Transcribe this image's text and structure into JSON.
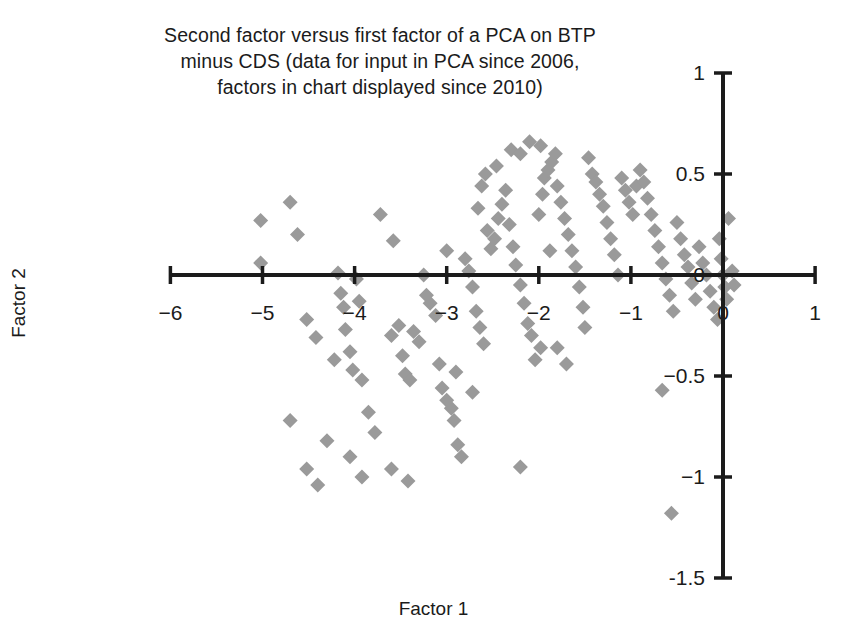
{
  "chart_data": {
    "type": "scatter",
    "title": "Second factor versus first factor of a PCA on BTP\nminus CDS (data for input in PCA since 2006,\nfactors in chart displayed since 2010)",
    "xlabel": "Factor 1",
    "ylabel": "Factor 2",
    "xlim": [
      -6.3,
      1.3
    ],
    "ylim": [
      -1.6,
      1.1
    ],
    "xticks": [
      -6,
      -5,
      -4,
      -3,
      -2,
      -1,
      0,
      1
    ],
    "xtick_labels": [
      "−6",
      "−5",
      "−4",
      "−3",
      "−2",
      "−1",
      "0",
      "1"
    ],
    "yticks": [
      1,
      0.5,
      0,
      -0.5,
      -1,
      -1.5
    ],
    "ytick_labels": [
      "1",
      "0.5",
      "0",
      "−0.5",
      "−1",
      "-1.5"
    ],
    "grid": false,
    "legend": null,
    "marker": "diamond",
    "marker_color": "#9a9a9a",
    "axis_color": "#1b1b1b",
    "axes_style": "crossed-at-origin",
    "series": [
      {
        "name": "BTP minus CDS PCA factors",
        "points": [
          [
            -5.02,
            0.27
          ],
          [
            -5.02,
            0.06
          ],
          [
            -4.52,
            -0.22
          ],
          [
            -4.42,
            -0.31
          ],
          [
            -4.22,
            -0.42
          ],
          [
            -4.18,
            0.01
          ],
          [
            -4.15,
            -0.09
          ],
          [
            -4.12,
            -0.16
          ],
          [
            -4.1,
            -0.27
          ],
          [
            -4.05,
            -0.38
          ],
          [
            -4.02,
            -0.47
          ],
          [
            -3.98,
            -0.02
          ],
          [
            -3.95,
            -0.13
          ],
          [
            -3.92,
            -0.52
          ],
          [
            -3.85,
            -0.68
          ],
          [
            -3.78,
            -0.78
          ],
          [
            -3.72,
            0.3
          ],
          [
            -3.6,
            -0.3
          ],
          [
            -3.58,
            0.17
          ],
          [
            -3.52,
            -0.25
          ],
          [
            -3.48,
            -0.4
          ],
          [
            -3.45,
            -0.49
          ],
          [
            -3.4,
            -0.52
          ],
          [
            -3.36,
            -0.28
          ],
          [
            -3.3,
            -0.33
          ],
          [
            -3.25,
            0.0
          ],
          [
            -3.22,
            -0.1
          ],
          [
            -3.18,
            -0.14
          ],
          [
            -3.12,
            -0.2
          ],
          [
            -3.08,
            -0.44
          ],
          [
            -3.05,
            -0.56
          ],
          [
            -3.0,
            -0.62
          ],
          [
            -2.95,
            -0.66
          ],
          [
            -2.92,
            -0.72
          ],
          [
            -2.88,
            -0.84
          ],
          [
            -2.84,
            -0.9
          ],
          [
            -2.8,
            0.08
          ],
          [
            -2.76,
            0.02
          ],
          [
            -2.72,
            -0.06
          ],
          [
            -2.68,
            -0.18
          ],
          [
            -2.64,
            -0.26
          ],
          [
            -2.6,
            -0.34
          ],
          [
            -2.56,
            0.22
          ],
          [
            -2.52,
            0.13
          ],
          [
            -2.48,
            0.18
          ],
          [
            -2.44,
            0.28
          ],
          [
            -2.4,
            0.35
          ],
          [
            -2.36,
            0.42
          ],
          [
            -2.32,
            0.25
          ],
          [
            -2.28,
            0.14
          ],
          [
            -2.25,
            0.05
          ],
          [
            -2.2,
            -0.05
          ],
          [
            -2.16,
            -0.14
          ],
          [
            -2.12,
            -0.24
          ],
          [
            -2.08,
            -0.3
          ],
          [
            -2.04,
            -0.42
          ],
          [
            -2.0,
            0.3
          ],
          [
            -1.96,
            0.4
          ],
          [
            -1.94,
            0.48
          ],
          [
            -1.9,
            0.52
          ],
          [
            -1.86,
            0.56
          ],
          [
            -1.82,
            0.6
          ],
          [
            -1.8,
            0.44
          ],
          [
            -1.76,
            0.36
          ],
          [
            -1.72,
            0.28
          ],
          [
            -1.68,
            0.2
          ],
          [
            -1.64,
            0.12
          ],
          [
            -1.6,
            0.04
          ],
          [
            -1.56,
            -0.06
          ],
          [
            -1.52,
            -0.16
          ],
          [
            -1.5,
            -0.26
          ],
          [
            -1.46,
            0.58
          ],
          [
            -1.42,
            0.5
          ],
          [
            -1.38,
            0.46
          ],
          [
            -1.34,
            0.4
          ],
          [
            -1.3,
            0.34
          ],
          [
            -1.26,
            0.26
          ],
          [
            -1.22,
            0.18
          ],
          [
            -1.18,
            0.1
          ],
          [
            -1.14,
            0.0
          ],
          [
            -1.1,
            0.48
          ],
          [
            -1.06,
            0.42
          ],
          [
            -1.02,
            0.36
          ],
          [
            -0.98,
            0.3
          ],
          [
            -0.94,
            0.44
          ],
          [
            -0.9,
            0.52
          ],
          [
            -0.86,
            0.46
          ],
          [
            -0.82,
            0.38
          ],
          [
            -0.78,
            0.3
          ],
          [
            -0.74,
            0.22
          ],
          [
            -0.7,
            0.14
          ],
          [
            -0.66,
            0.06
          ],
          [
            -0.62,
            -0.02
          ],
          [
            -0.58,
            -0.1
          ],
          [
            -0.54,
            -0.18
          ],
          [
            -0.5,
            0.26
          ],
          [
            -0.46,
            0.18
          ],
          [
            -0.42,
            0.1
          ],
          [
            -0.38,
            0.04
          ],
          [
            -0.34,
            -0.04
          ],
          [
            -0.3,
            -0.12
          ],
          [
            -0.26,
            0.14
          ],
          [
            -0.22,
            0.06
          ],
          [
            -0.18,
            0.0
          ],
          [
            -0.14,
            -0.08
          ],
          [
            -0.1,
            -0.16
          ],
          [
            -0.06,
            -0.22
          ],
          [
            -0.04,
            0.18
          ],
          [
            -0.02,
            0.08
          ],
          [
            0.0,
            0.0
          ],
          [
            0.02,
            -0.06
          ],
          [
            0.04,
            -0.12
          ],
          [
            0.06,
            0.28
          ],
          [
            0.1,
            0.02
          ],
          [
            0.12,
            -0.05
          ],
          [
            -0.66,
            -0.57
          ],
          [
            -0.56,
            -1.18
          ],
          [
            -4.7,
            -0.72
          ],
          [
            -4.52,
            -0.96
          ],
          [
            -4.4,
            -1.04
          ],
          [
            -4.3,
            -0.82
          ],
          [
            -4.05,
            -0.9
          ],
          [
            -3.92,
            -1.0
          ],
          [
            -3.6,
            -0.96
          ],
          [
            -3.42,
            -1.02
          ],
          [
            -2.9,
            -0.48
          ],
          [
            -2.72,
            -0.58
          ],
          [
            -2.2,
            -0.95
          ],
          [
            -1.98,
            -0.36
          ],
          [
            -3.0,
            0.12
          ],
          [
            -2.66,
            0.33
          ],
          [
            -2.62,
            0.44
          ],
          [
            -2.58,
            0.5
          ],
          [
            -2.46,
            0.54
          ],
          [
            -2.3,
            0.62
          ],
          [
            -2.2,
            0.6
          ],
          [
            -2.1,
            0.66
          ],
          [
            -1.98,
            0.64
          ],
          [
            -1.88,
            0.12
          ],
          [
            -1.8,
            -0.36
          ],
          [
            -1.7,
            -0.44
          ],
          [
            -4.7,
            0.36
          ],
          [
            -4.62,
            0.2
          ]
        ]
      }
    ]
  },
  "axis_title_x": "Factor 1",
  "axis_title_y": "Factor 2"
}
